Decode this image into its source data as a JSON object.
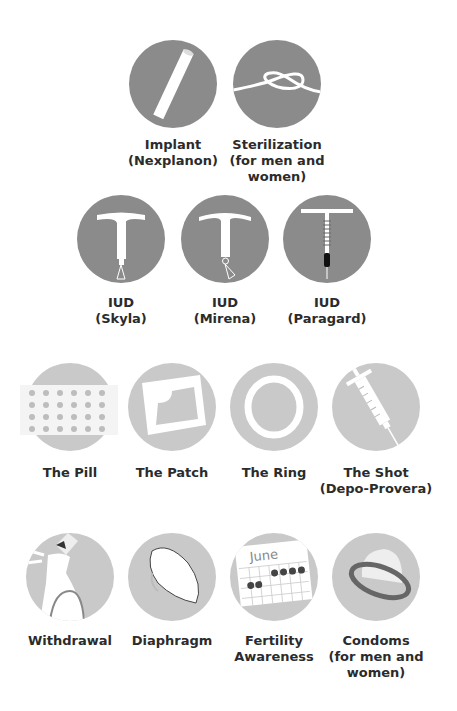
{
  "colors": {
    "dark_circle": "#8b8b8b",
    "light_circle": "#c9c9c9",
    "text": "#2b2b2b"
  },
  "rows": [
    {
      "tier": "most-effective",
      "items": [
        {
          "id": "implant",
          "icon": "implant-rod-icon",
          "line1": "Implant",
          "line2": "(Nexplanon)",
          "line3": ""
        },
        {
          "id": "sterilization",
          "icon": "knot-icon",
          "line1": "Sterilization",
          "line2": "(for men and",
          "line3": "women)"
        }
      ]
    },
    {
      "tier": "most-effective",
      "items": [
        {
          "id": "iud-skyla",
          "icon": "iud-hormonal-icon",
          "line1": "IUD",
          "line2": "(Skyla)",
          "line3": ""
        },
        {
          "id": "iud-mirena",
          "icon": "iud-hormonal-icon",
          "line1": "IUD",
          "line2": "(Mirena)",
          "line3": ""
        },
        {
          "id": "iud-paragard",
          "icon": "iud-copper-icon",
          "line1": "IUD",
          "line2": "(Paragard)",
          "line3": ""
        }
      ]
    },
    {
      "tier": "moderately-effective",
      "items": [
        {
          "id": "pill",
          "icon": "pill-pack-icon",
          "line1": "The Pill",
          "line2": "",
          "line3": ""
        },
        {
          "id": "patch",
          "icon": "patch-icon",
          "line1": "The Patch",
          "line2": "",
          "line3": ""
        },
        {
          "id": "ring",
          "icon": "ring-icon",
          "line1": "The Ring",
          "line2": "",
          "line3": ""
        },
        {
          "id": "shot",
          "icon": "syringe-icon",
          "line1": "The Shot",
          "line2": "(Depo-Provera)",
          "line3": ""
        }
      ]
    },
    {
      "tier": "less-effective",
      "items": [
        {
          "id": "withdrawal",
          "icon": "withdrawal-icon",
          "line1": "Withdrawal",
          "line2": "",
          "line3": ""
        },
        {
          "id": "diaphragm",
          "icon": "diaphragm-icon",
          "line1": "Diaphragm",
          "line2": "",
          "line3": ""
        },
        {
          "id": "fertility",
          "icon": "calendar-icon",
          "line1": "Fertility",
          "line2": "Awareness",
          "line3": "",
          "calendar_month": "June"
        },
        {
          "id": "condoms",
          "icon": "condom-icon",
          "line1": "Condoms",
          "line2": "(for men and",
          "line3": "women)"
        }
      ]
    }
  ]
}
